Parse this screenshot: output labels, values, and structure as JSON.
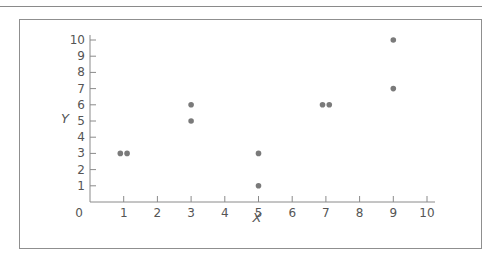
{
  "chart_data": {
    "type": "scatter",
    "title": "",
    "xlabel": "X",
    "ylabel": "Y",
    "xlim": [
      0,
      10
    ],
    "ylim": [
      0,
      10
    ],
    "grid": false,
    "legend": "none",
    "x_ticks": [
      "0",
      "1",
      "2",
      "3",
      "4",
      "5",
      "6",
      "7",
      "8",
      "9",
      "10"
    ],
    "y_ticks": [
      "1",
      "2",
      "3",
      "4",
      "5",
      "6",
      "7",
      "8",
      "9",
      "10"
    ],
    "points": [
      {
        "x": 0.9,
        "y": 3
      },
      {
        "x": 1.1,
        "y": 3
      },
      {
        "x": 3,
        "y": 5
      },
      {
        "x": 3,
        "y": 6
      },
      {
        "x": 5,
        "y": 1
      },
      {
        "x": 5,
        "y": 3
      },
      {
        "x": 6.9,
        "y": 6
      },
      {
        "x": 7.1,
        "y": 6
      },
      {
        "x": 9,
        "y": 7
      },
      {
        "x": 9,
        "y": 10
      }
    ],
    "colors": {
      "point": "#7a7a7a",
      "axis": "#8a8a8a",
      "text": "#555555"
    }
  }
}
